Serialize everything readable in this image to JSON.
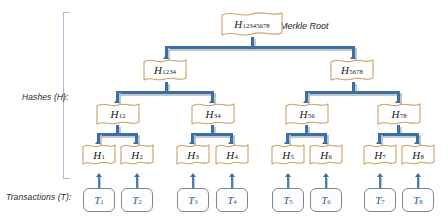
{
  "diagram": {
    "root_annotation": "Merkle Root",
    "labels": {
      "hashes": "Hashes (H):",
      "transactions": "Transactions (T):"
    },
    "colors": {
      "flag_border": "#c8a165",
      "flag_fill": "#ffffff",
      "connector": "#3c6fa5",
      "connector_shadow": "#b9bec4",
      "bracket": "#a9bcd4",
      "txn_border": "#7b8795",
      "txn_text": "#2e5c8a",
      "label_text": "#2b2b2b"
    },
    "root": {
      "prefix": "H",
      "subscript": "12345678"
    },
    "level2": [
      {
        "prefix": "H",
        "subscript": "1234"
      },
      {
        "prefix": "H",
        "subscript": "5678"
      }
    ],
    "level3": [
      {
        "prefix": "H",
        "subscript": "12"
      },
      {
        "prefix": "H",
        "subscript": "34"
      },
      {
        "prefix": "H",
        "subscript": "56"
      },
      {
        "prefix": "H",
        "subscript": "78"
      }
    ],
    "leaves": [
      {
        "prefix": "H",
        "subscript": "1"
      },
      {
        "prefix": "H",
        "subscript": "2"
      },
      {
        "prefix": "H",
        "subscript": "3"
      },
      {
        "prefix": "H",
        "subscript": "4"
      },
      {
        "prefix": "H",
        "subscript": "5"
      },
      {
        "prefix": "H",
        "subscript": "6"
      },
      {
        "prefix": "H",
        "subscript": "7"
      },
      {
        "prefix": "H",
        "subscript": "8"
      }
    ],
    "transactions": [
      {
        "prefix": "T",
        "subscript": "1"
      },
      {
        "prefix": "T",
        "subscript": "2"
      },
      {
        "prefix": "T",
        "subscript": "3"
      },
      {
        "prefix": "T",
        "subscript": "4"
      },
      {
        "prefix": "T",
        "subscript": "5"
      },
      {
        "prefix": "T",
        "subscript": "6"
      },
      {
        "prefix": "T",
        "subscript": "7"
      },
      {
        "prefix": "T",
        "subscript": "8"
      }
    ]
  }
}
